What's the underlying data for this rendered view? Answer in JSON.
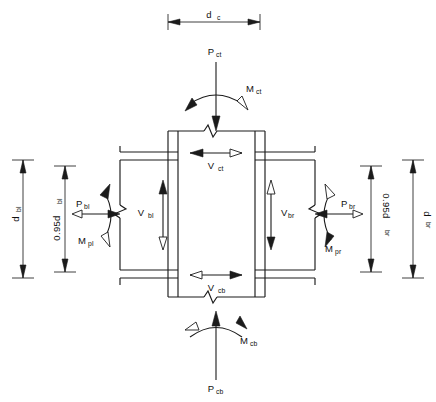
{
  "figure": {
    "background_color": "#ffffff",
    "line_color": "#1b1b1b"
  },
  "dimensions": {
    "column_depth": {
      "base": "d",
      "sub": "c",
      "label": "d_c",
      "orientation": "horizontal",
      "position": "top"
    },
    "beam_left_depth": {
      "base": "d",
      "sub": "bl",
      "label": "d_bl",
      "orientation": "vertical",
      "position": "far-left"
    },
    "beam_left_lever": {
      "base": "0.95d",
      "sub": "bl",
      "label": "0.95d_bl",
      "orientation": "vertical",
      "position": "inner-left"
    },
    "beam_right_lever": {
      "base": "0.95d",
      "sub": "br",
      "label": "0.95d_br",
      "orientation": "vertical",
      "position": "inner-right"
    },
    "beam_right_depth": {
      "base": "d",
      "sub": "br",
      "label": "d_br",
      "orientation": "vertical",
      "position": "far-right"
    }
  },
  "forces": {
    "column_top_axial": {
      "base": "P",
      "sub": "ct",
      "label": "P_ct",
      "direction": "down",
      "location": "column-top"
    },
    "column_bottom_axial": {
      "base": "P",
      "sub": "cb",
      "label": "P_cb",
      "direction": "up",
      "location": "column-bottom"
    },
    "beam_left_flange_force": {
      "base": "P",
      "sub": "bl",
      "label": "P_bl",
      "direction": "horizontal-pair",
      "location": "beam-left"
    },
    "beam_right_flange_force": {
      "base": "P",
      "sub": "br",
      "label": "P_br",
      "direction": "horizontal-pair",
      "location": "beam-right"
    }
  },
  "moments": {
    "column_top_moment": {
      "base": "M",
      "sub": "ct",
      "label": "M_ct",
      "location": "column-top",
      "sense": "curved-arc"
    },
    "column_bottom_moment": {
      "base": "M",
      "sub": "cb",
      "label": "M_cb",
      "location": "column-bottom",
      "sense": "curved-arc"
    },
    "beam_left_plastic_moment": {
      "base": "M",
      "sub": "pl",
      "label": "M_pl",
      "location": "beam-left",
      "sense": "curved-arc"
    },
    "beam_right_plastic_moment": {
      "base": "M",
      "sub": "pr",
      "label": "M_pr",
      "location": "beam-right",
      "sense": "curved-arc"
    }
  },
  "shears": {
    "column_top_shear": {
      "base": "V",
      "sub": "ct",
      "label": "V_ct",
      "orientation": "horizontal",
      "location": "column-top-panel"
    },
    "column_bottom_shear": {
      "base": "V",
      "sub": "cb",
      "label": "V_cb",
      "orientation": "horizontal",
      "location": "column-bottom-panel"
    },
    "beam_left_shear": {
      "base": "V",
      "sub": "bl",
      "label": "V_bl",
      "orientation": "vertical",
      "location": "beam-left-panel"
    },
    "beam_right_shear": {
      "base": "V",
      "sub": "br",
      "label": "V_br",
      "orientation": "vertical",
      "location": "beam-right-panel"
    }
  },
  "members": {
    "column": {
      "name": "column",
      "break_symbols": [
        "top",
        "bottom"
      ]
    },
    "beam_left": {
      "name": "left-beam",
      "break_symbols": [
        "end"
      ]
    },
    "beam_right": {
      "name": "right-beam",
      "break_symbols": [
        "end"
      ]
    }
  }
}
